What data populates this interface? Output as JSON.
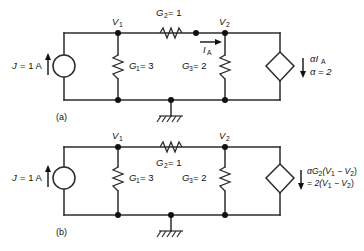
{
  "figure": {
    "line_color": "#2b2b2b",
    "text_color": "#111111",
    "background": "#ffffff"
  },
  "circuits": [
    {
      "caption": "(a)",
      "source": {
        "label": "J = 1 A",
        "label_main": "J",
        "label_eq": "= 1 A",
        "type": "independent-current-source",
        "direction": "up"
      },
      "nodes": [
        {
          "name": "V1",
          "label_main": "V",
          "label_sub": "1"
        },
        {
          "name": "V2",
          "label_main": "V",
          "label_sub": "2"
        }
      ],
      "elements": [
        {
          "name": "G2",
          "label_main": "G",
          "label_sub": "2",
          "label_eq": "= 1",
          "value": 1,
          "orientation": "horizontal",
          "label_position": "above"
        },
        {
          "name": "G1",
          "label_main": "G",
          "label_sub": "1",
          "label_eq": "= 3",
          "value": 3,
          "orientation": "vertical",
          "label_position": "right"
        },
        {
          "name": "G3",
          "label_main": "G",
          "label_sub": "3",
          "label_eq": "= 2",
          "value": 2,
          "orientation": "vertical",
          "label_position": "left"
        }
      ],
      "current": {
        "name": "IA",
        "label_main": "I",
        "label_sub": "A",
        "direction": "right"
      },
      "dependent_source": {
        "type": "current-controlled-current-source",
        "shape": "diamond",
        "direction": "down",
        "line1_main": "αI",
        "line1_sub": "A",
        "line2": "α = 2"
      },
      "ground": {
        "label": "ground",
        "symbol": "earth"
      }
    },
    {
      "caption": "(b)",
      "source": {
        "label": "J = 1 A",
        "label_main": "J",
        "label_eq": "= 1 A",
        "type": "independent-current-source",
        "direction": "up"
      },
      "nodes": [
        {
          "name": "V1",
          "label_main": "V",
          "label_sub": "1"
        },
        {
          "name": "V2",
          "label_main": "V",
          "label_sub": "2"
        }
      ],
      "elements": [
        {
          "name": "G2",
          "label_main": "G",
          "label_sub": "2",
          "label_eq": "= 1",
          "value": 1,
          "orientation": "horizontal",
          "label_position": "below"
        },
        {
          "name": "G1",
          "label_main": "G",
          "label_sub": "1",
          "label_eq": "= 3",
          "value": 3,
          "orientation": "vertical",
          "label_position": "right"
        },
        {
          "name": "G3",
          "label_main": "G",
          "label_sub": "3",
          "label_eq": "= 2",
          "value": 2,
          "orientation": "vertical",
          "label_position": "left"
        }
      ],
      "dependent_source": {
        "type": "voltage-controlled-current-source",
        "shape": "diamond",
        "direction": "down",
        "line1_pre": "αG",
        "line1_sub": "2",
        "line1_post": "(V",
        "line1_sub2": "1",
        "line1_mid": " − V",
        "line1_sub3": "2",
        "line1_end": ")",
        "line2_pre": "= 2(V",
        "line2_sub1": "1",
        "line2_mid": " − V",
        "line2_sub2": "2",
        "line2_end": ")"
      },
      "ground": {
        "label": "ground",
        "symbol": "earth"
      }
    }
  ]
}
